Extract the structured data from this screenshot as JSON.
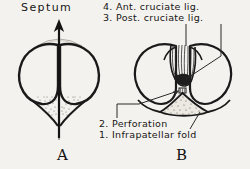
{
  "figure": {
    "background_color": "#f4f2ee",
    "ink_color": "#161616",
    "caption_a": "A",
    "caption_b": "B"
  },
  "labels": {
    "septum": "Septum",
    "item4": "4. Ant. cruciate lig.",
    "item3": "3. Post. cruciate lig.",
    "item2": "2. Perforation",
    "item1": "1. Infrapatellar fold"
  },
  "panels": [
    {
      "id": "A",
      "caption": "A",
      "description": "Two oval condyle outlines separated by a vertical septum with an upward arrow"
    },
    {
      "id": "B",
      "caption": "B",
      "description": "Two rounded condyles with central cruciate ligaments and stippled infrapatellar fold"
    }
  ]
}
